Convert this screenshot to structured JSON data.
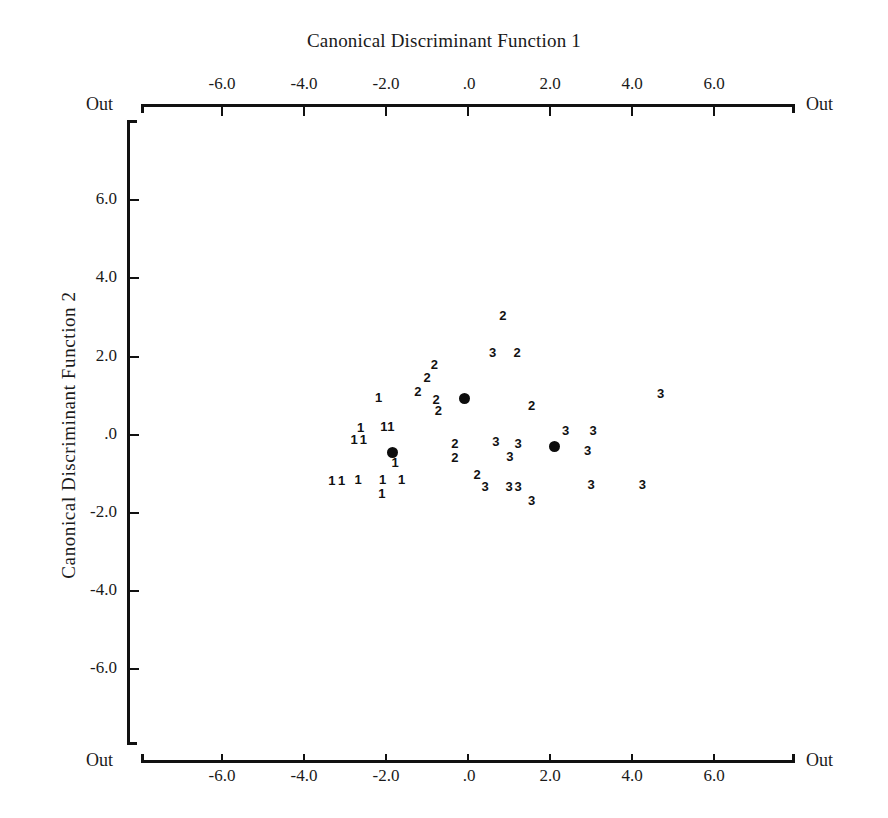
{
  "chart_data": {
    "type": "scatter",
    "title": "Canonical Discriminant Function 1",
    "xlabel": "Canonical Discriminant Function 1",
    "ylabel": "Canonical Discriminant  Function  2",
    "xlim": [
      -8.0,
      8.0
    ],
    "ylim": [
      -8.0,
      8.0
    ],
    "grid": false,
    "legend": "none",
    "x_ticks": [
      "-6.0",
      "-4.0",
      "-2.0",
      ".0",
      "2.0",
      "4.0",
      "6.0"
    ],
    "x_tick_values": [
      -6.0,
      -4.0,
      -2.0,
      0.0,
      2.0,
      4.0,
      6.0
    ],
    "y_ticks": [
      "6.0",
      "4.0",
      "2.0",
      ".0",
      "-2.0",
      "-4.0",
      "-6.0"
    ],
    "y_tick_values": [
      6.0,
      4.0,
      2.0,
      0.0,
      -2.0,
      -4.0,
      -6.0
    ],
    "out_label": "Out",
    "out_markers": [
      "Out",
      "Out",
      "Out",
      "Out"
    ],
    "series": [
      {
        "name": "1",
        "label": "1",
        "marker": "digit-1",
        "points": [
          [
            -2.18,
            0.95
          ],
          [
            -2.62,
            0.18
          ],
          [
            -2.05,
            0.2
          ],
          [
            -1.88,
            0.2
          ],
          [
            -2.78,
            -0.12
          ],
          [
            -2.55,
            -0.12
          ],
          [
            -3.32,
            -1.18
          ],
          [
            -3.08,
            -1.18
          ],
          [
            -2.68,
            -1.15
          ],
          [
            -2.08,
            -1.15
          ],
          [
            -1.62,
            -1.15
          ],
          [
            -1.78,
            -0.72
          ],
          [
            -2.1,
            -1.5
          ]
        ]
      },
      {
        "name": "2",
        "label": "2",
        "marker": "digit-2",
        "points": [
          [
            0.85,
            3.05
          ],
          [
            1.2,
            2.1
          ],
          [
            -0.82,
            1.8
          ],
          [
            -1.0,
            1.45
          ],
          [
            -1.22,
            1.1
          ],
          [
            -0.78,
            0.9
          ],
          [
            -0.72,
            0.62
          ],
          [
            1.55,
            0.75
          ],
          [
            -0.32,
            -0.22
          ],
          [
            -0.32,
            -0.58
          ],
          [
            0.22,
            -1.02
          ]
        ]
      },
      {
        "name": "3",
        "label": "3",
        "marker": "digit-3",
        "points": [
          [
            0.6,
            2.1
          ],
          [
            4.7,
            1.05
          ],
          [
            2.38,
            0.1
          ],
          [
            3.05,
            0.1
          ],
          [
            0.68,
            -0.18
          ],
          [
            1.22,
            -0.22
          ],
          [
            2.92,
            -0.42
          ],
          [
            1.02,
            -0.55
          ],
          [
            0.42,
            -1.32
          ],
          [
            1.0,
            -1.32
          ],
          [
            1.22,
            -1.32
          ],
          [
            3.0,
            -1.28
          ],
          [
            4.25,
            -1.28
          ],
          [
            1.55,
            -1.68
          ]
        ]
      }
    ],
    "centroids": [
      {
        "group": "1",
        "x": -1.85,
        "y": -0.42
      },
      {
        "group": "2",
        "x": -0.08,
        "y": 0.95
      },
      {
        "group": "3",
        "x": 2.12,
        "y": -0.28
      }
    ],
    "centroid_marker": "filled-circle"
  },
  "colors": {
    "axis": "#111111",
    "text": "#1a1a1a",
    "point": "#111111",
    "background": "#ffffff"
  }
}
